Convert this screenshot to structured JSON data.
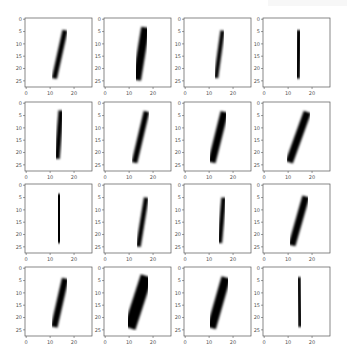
{
  "figure": {
    "layout": {
      "rows": 4,
      "cols": 4
    },
    "col_x": [
      25,
      104,
      184,
      263
    ],
    "row_y": [
      18,
      102,
      184,
      267
    ],
    "ax_width": 67,
    "ax_height": 69
  },
  "chart_data": {
    "type": "heatmap",
    "title": "",
    "image_size": [
      28,
      28
    ],
    "xlabel": "",
    "ylabel": "",
    "xticks": [
      0,
      10,
      20
    ],
    "yticks": [
      0,
      5,
      10,
      15,
      20,
      25
    ],
    "xlim": [
      -0.5,
      27.5
    ],
    "ylim": [
      27.5,
      -0.5
    ],
    "grid": false,
    "panels": [
      {
        "row": 0,
        "col": 0,
        "label": "1",
        "stroke": {
          "x_top": 16,
          "y_top": 5.5,
          "x_bottom": 12,
          "y_bottom": 23,
          "width": 2.2
        }
      },
      {
        "row": 0,
        "col": 1,
        "label": "1",
        "stroke": {
          "x_top": 16.5,
          "y_top": 5,
          "x_bottom": 13.5,
          "y_bottom": 23,
          "width": 3.5
        }
      },
      {
        "row": 0,
        "col": 2,
        "label": "1",
        "stroke": {
          "x_top": 15.5,
          "y_top": 5.5,
          "x_bottom": 13,
          "y_bottom": 23,
          "width": 1.8
        }
      },
      {
        "row": 0,
        "col": 3,
        "label": "1",
        "stroke": {
          "x_top": 14.5,
          "y_top": 5.5,
          "x_bottom": 14,
          "y_bottom": 23,
          "width": 2.2
        }
      },
      {
        "row": 1,
        "col": 0,
        "label": "1",
        "stroke": {
          "x_top": 14.5,
          "y_top": 4,
          "x_bottom": 13,
          "y_bottom": 21.5,
          "width": 2.2
        }
      },
      {
        "row": 1,
        "col": 1,
        "label": "1",
        "stroke": {
          "x_top": 17,
          "y_top": 4.5,
          "x_bottom": 12.5,
          "y_bottom": 23,
          "width": 2.4
        }
      },
      {
        "row": 1,
        "col": 2,
        "label": "1",
        "stroke": {
          "x_top": 16,
          "y_top": 5,
          "x_bottom": 11.5,
          "y_bottom": 22.5,
          "width": 3.2
        }
      },
      {
        "row": 1,
        "col": 3,
        "label": "1",
        "stroke": {
          "x_top": 17.5,
          "y_top": 5,
          "x_bottom": 11,
          "y_bottom": 22.5,
          "width": 3.2
        }
      },
      {
        "row": 2,
        "col": 0,
        "label": "1",
        "stroke": {
          "x_top": 13.5,
          "y_top": 5,
          "x_bottom": 14,
          "y_bottom": 22,
          "width": 3
        }
      },
      {
        "row": 2,
        "col": 1,
        "label": "1",
        "stroke": {
          "x_top": 17,
          "y_top": 6,
          "x_bottom": 14,
          "y_bottom": 24,
          "width": 2
        }
      },
      {
        "row": 2,
        "col": 2,
        "label": "1",
        "stroke": {
          "x_top": 16,
          "y_top": 6,
          "x_bottom": 14.5,
          "y_bottom": 22.5,
          "width": 2
        }
      },
      {
        "row": 2,
        "col": 3,
        "label": "1",
        "stroke": {
          "x_top": 17,
          "y_top": 6,
          "x_bottom": 12,
          "y_bottom": 23,
          "width": 3
        }
      },
      {
        "row": 3,
        "col": 0,
        "label": "1",
        "stroke": {
          "x_top": 16,
          "y_top": 5.5,
          "x_bottom": 12,
          "y_bottom": 22.5,
          "width": 2.8
        }
      },
      {
        "row": 3,
        "col": 1,
        "label": "1",
        "stroke": {
          "x_top": 16.5,
          "y_top": 5.5,
          "x_bottom": 11,
          "y_bottom": 22,
          "width": 5
        }
      },
      {
        "row": 3,
        "col": 2,
        "label": "1",
        "stroke": {
          "x_top": 16.5,
          "y_top": 5.5,
          "x_bottom": 11.5,
          "y_bottom": 22.5,
          "width": 3.8
        }
      },
      {
        "row": 3,
        "col": 3,
        "label": "1",
        "stroke": {
          "x_top": 14.5,
          "y_top": 4.5,
          "x_bottom": 15,
          "y_bottom": 23,
          "width": 1.8
        }
      }
    ],
    "colors": {
      "background": "#ffffff",
      "ink": "#000000",
      "frame": "#555555",
      "tick_label": "#555555"
    }
  }
}
